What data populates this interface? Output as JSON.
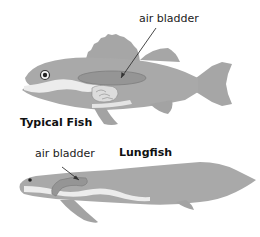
{
  "diagram": {
    "typical_fish": {
      "title": "Typical Fish",
      "labels": [
        {
          "text": "air bladder"
        }
      ]
    },
    "lungfish": {
      "title": "Lungfish",
      "labels": [
        {
          "text": "air bladder"
        }
      ]
    }
  },
  "colors": {
    "body": "#a9a9a9",
    "fin": "#a3a3a3",
    "bladder": "#8f8f8f",
    "belly_stripe": "#ececec",
    "outline": "#8a8a8a",
    "text": "#222222"
  }
}
